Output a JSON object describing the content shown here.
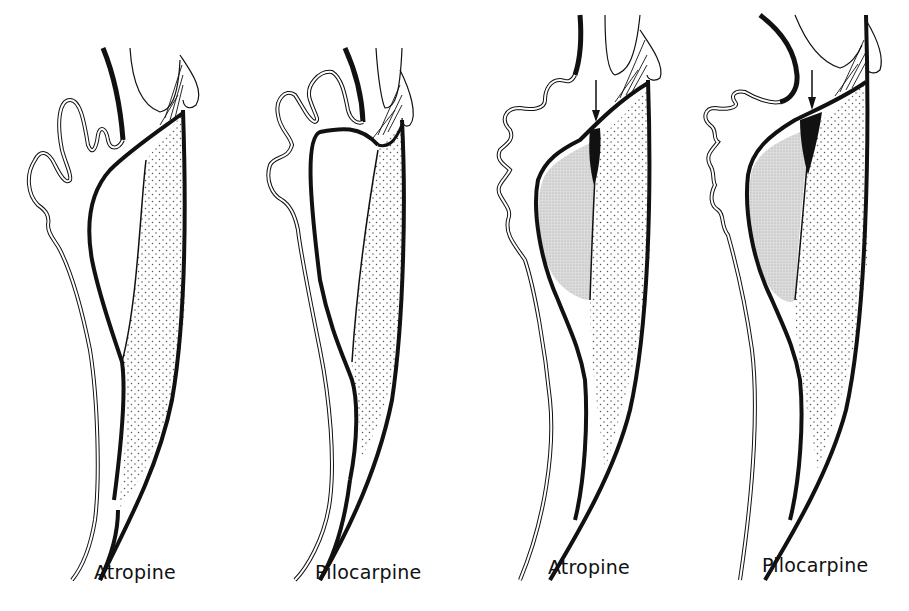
{
  "figure": {
    "panels": [
      {
        "id": "panel-1",
        "label": "Atropine",
        "arrow": false,
        "label_x": 94,
        "label_y": 560
      },
      {
        "id": "panel-2",
        "label": "Pilocarpine",
        "arrow": false,
        "label_x": 315,
        "label_y": 560
      },
      {
        "id": "panel-3",
        "label": "Atropine",
        "arrow": true,
        "label_x": 548,
        "label_y": 556
      },
      {
        "id": "panel-4",
        "label": "Pilocarpine",
        "arrow": true,
        "label_x": 762,
        "label_y": 554
      }
    ],
    "colors": {
      "ink": "#111111",
      "background": "#ffffff",
      "stipple_light": "#e6e6e6",
      "stipple_dot": "#555555"
    }
  }
}
